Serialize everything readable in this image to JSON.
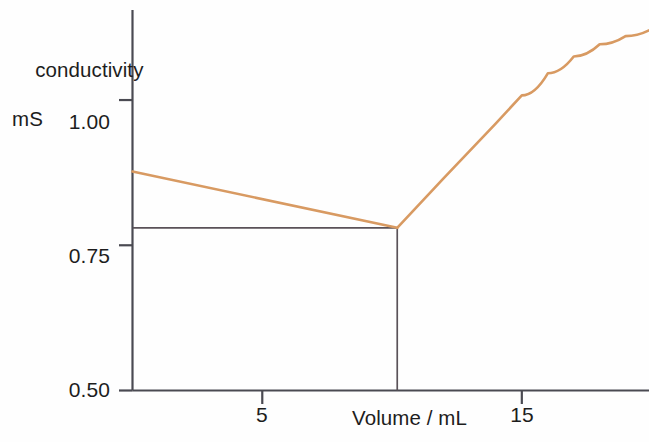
{
  "chart_data": {
    "type": "line",
    "title": "",
    "subtitle": "",
    "xlabel": "Volume / mL",
    "ylabel": "conductivity\nmS",
    "ylabel_lines": [
      "conductivity",
      "mS"
    ],
    "xlim": [
      0,
      19.9
    ],
    "ylim": [
      0.5,
      1.155
    ],
    "grid": false,
    "legend": null,
    "x_ticks": [
      5,
      15
    ],
    "x_tick_labels": [
      "5",
      "15"
    ],
    "y_ticks": [
      0.5,
      0.75,
      1.0
    ],
    "y_tick_labels": [
      "0.50",
      "0.75",
      "1.00"
    ],
    "series": [
      {
        "name": "conductivity curve",
        "color": "#d89a62",
        "points": [
          {
            "x": 0.0,
            "y": 0.877
          },
          {
            "x": 10.2,
            "y": 0.78
          },
          {
            "x": 12.0,
            "y": 0.866
          },
          {
            "x": 14.0,
            "y": 0.96
          },
          {
            "x": 15.0,
            "y": 1.008
          },
          {
            "x": 16.0,
            "y": 1.046
          },
          {
            "x": 17.0,
            "y": 1.075
          },
          {
            "x": 18.0,
            "y": 1.096
          },
          {
            "x": 19.0,
            "y": 1.11
          },
          {
            "x": 19.9,
            "y": 1.12
          }
        ]
      }
    ],
    "annotations": [
      {
        "name": "equivalence-horizontal-guide",
        "type": "horizontal-line",
        "y": 0.78,
        "x_start": 0.0,
        "x_end": 10.2,
        "color": "#5a5258"
      },
      {
        "name": "equivalence-vertical-guide",
        "type": "vertical-line",
        "x": 10.2,
        "y_start": 0.5,
        "y_end": 0.78,
        "color": "#5a5258"
      }
    ],
    "equivalence_point": {
      "x": 10.2,
      "y": 0.78
    },
    "axis_color": "#4a4a52"
  },
  "axes": {
    "y_title_line1": "conductivity",
    "y_title_line2": "mS",
    "x_title": "Volume / mL",
    "y_tick_100": "1.00",
    "y_tick_075": "0.75",
    "y_tick_050": "0.50",
    "x_tick_5": "5",
    "x_tick_15": "15"
  }
}
